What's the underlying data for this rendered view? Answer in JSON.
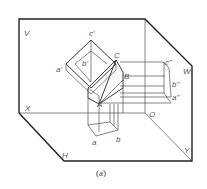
{
  "diagram": {
    "caption": "(a)",
    "planes": {
      "V": "V",
      "H": "H",
      "W": "W"
    },
    "axes": {
      "X": "X",
      "Y": "Y",
      "O": "O"
    },
    "points": {
      "A": "A",
      "B": "B",
      "C": "C",
      "a": "a",
      "b": "b",
      "a_prime": "a'",
      "b_prime": "b'",
      "c_prime": "c'",
      "a_dprime": "a\"",
      "b_dprime": "b\"",
      "c_dprime": "c\""
    }
  }
}
